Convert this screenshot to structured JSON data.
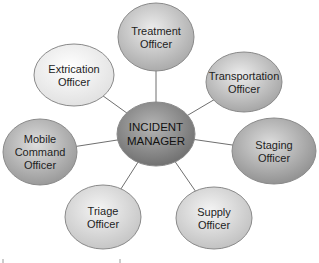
{
  "diagram": {
    "type": "hub-and-spoke",
    "center": {
      "id": "incident-manager",
      "lines": [
        "INCIDENT",
        "MANAGER"
      ],
      "cx": 156,
      "cy": 134,
      "rx": 39,
      "ry": 32,
      "fill_light": "#b5b5b5",
      "fill_dark": "#6e6e6e"
    },
    "nodes": [
      {
        "id": "treatment-officer",
        "lines": [
          "Treatment",
          "Officer"
        ],
        "cx": 156,
        "cy": 37,
        "rx": 38,
        "ry": 34,
        "fill_light": "#ececec",
        "fill_dark": "#a8a8a8"
      },
      {
        "id": "transportation-officer",
        "lines": [
          "Transportation",
          "Officer"
        ],
        "cx": 244,
        "cy": 82,
        "rx": 38,
        "ry": 30,
        "fill_light": "#ececec",
        "fill_dark": "#a3a3a3"
      },
      {
        "id": "staging-officer",
        "lines": [
          "Staging",
          "Officer"
        ],
        "cx": 274,
        "cy": 151,
        "rx": 42,
        "ry": 33,
        "fill_light": "#dcdcdc",
        "fill_dark": "#8f8f8f"
      },
      {
        "id": "supply-officer",
        "lines": [
          "Supply",
          "Officer"
        ],
        "cx": 214,
        "cy": 218,
        "rx": 38,
        "ry": 31,
        "fill_light": "#f4f4f4",
        "fill_dark": "#c0c0c0"
      },
      {
        "id": "triage-officer",
        "lines": [
          "Triage",
          "Officer"
        ],
        "cx": 103,
        "cy": 217,
        "rx": 38,
        "ry": 32,
        "fill_light": "#f4f4f4",
        "fill_dark": "#c4c4c4"
      },
      {
        "id": "mobile-command-officer",
        "lines": [
          "Mobile",
          "Command",
          "Officer"
        ],
        "cx": 40,
        "cy": 152,
        "rx": 37,
        "ry": 33,
        "fill_light": "#dedede",
        "fill_dark": "#979797"
      },
      {
        "id": "extrication-officer",
        "lines": [
          "Extrication",
          "Officer"
        ],
        "cx": 74,
        "cy": 75,
        "rx": 40,
        "ry": 31,
        "fill_light": "#ffffff",
        "fill_dark": "#e0e0e0"
      }
    ],
    "colors": {
      "background": "#ffffff",
      "connector": "#6f6f6f",
      "outline": "#8a8a8a",
      "text": "#1e1e1e"
    }
  }
}
